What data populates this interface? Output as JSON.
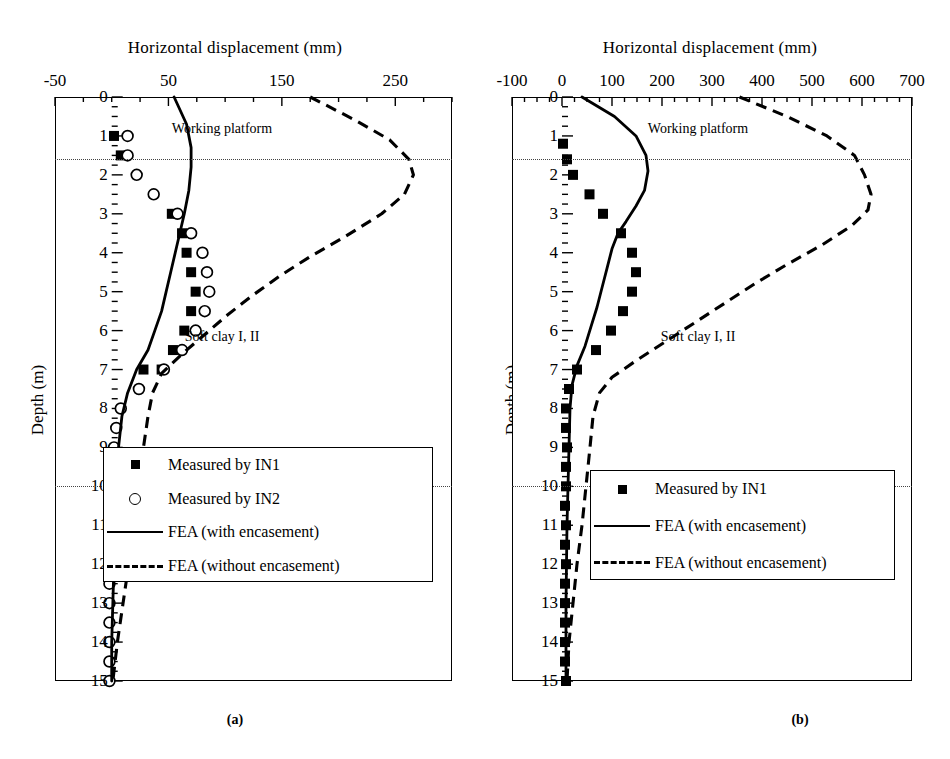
{
  "figure": {
    "panels": [
      {
        "id": "a",
        "caption": "(a)",
        "xlabel": "Horizontal displacement (mm)",
        "ylabel": "Depth (m)",
        "xticklabels": [
          "-50",
          "50",
          "150",
          "250"
        ],
        "xtickvalues": [
          -50,
          50,
          150,
          250
        ],
        "yticklabels": [
          "0",
          "1",
          "2",
          "3",
          "4",
          "5",
          "6",
          "7",
          "8",
          "9",
          "10",
          "11",
          "12",
          "13",
          "14",
          "15"
        ],
        "layer_labels": [
          "Working platform",
          "Soft clay I, II",
          "Stiff silty clay"
        ],
        "legend": [
          {
            "key": "square",
            "label": "Measured by IN1"
          },
          {
            "key": "circle",
            "label": "Measured by IN2"
          },
          {
            "key": "solid",
            "label": "FEA (with encasement)"
          },
          {
            "key": "dash",
            "label": "FEA (without encasement)"
          }
        ]
      },
      {
        "id": "b",
        "caption": "(b)",
        "xlabel": "Horizontal displacement (mm)",
        "ylabel": "Depth (m)",
        "xticklabels": [
          "-100",
          "0",
          "100",
          "200",
          "300",
          "400",
          "500",
          "600",
          "700"
        ],
        "xtickvalues": [
          -100,
          0,
          100,
          200,
          300,
          400,
          500,
          600,
          700
        ],
        "yticklabels": [
          "0",
          "1",
          "2",
          "3",
          "4",
          "5",
          "6",
          "7",
          "8",
          "9",
          "10",
          "11",
          "12",
          "13",
          "14",
          "15"
        ],
        "layer_labels": [
          "Working platform",
          "Soft clay I, II",
          "Stiff silty clay"
        ],
        "legend": [
          {
            "key": "square",
            "label": "Measured by IN1"
          },
          {
            "key": "solid",
            "label": "FEA (with encasement)"
          },
          {
            "key": "dash",
            "label": "FEA (without encasement)"
          }
        ]
      }
    ]
  },
  "chart_data": [
    {
      "type": "line",
      "title": "(a)",
      "xlabel": "Horizontal displacement (mm)",
      "ylabel": "Depth (m)",
      "xlim": [
        -50,
        300
      ],
      "ylim": [
        0,
        15
      ],
      "y_inverted": true,
      "xtick_major": [
        -50,
        50,
        150,
        250
      ],
      "xtick_minor_step": 25,
      "ytick_step": 1,
      "grid": false,
      "legend_position": "bottom-center",
      "layer_boundaries_depth_m": [
        1.6,
        10.0
      ],
      "layer_names": [
        "Working platform",
        "Soft clay I, II",
        "Stiff silty clay"
      ],
      "series": [
        {
          "name": "Measured by IN1",
          "style": "scatter-filled-square",
          "points": [
            {
              "x": 2,
              "depth": 1.0
            },
            {
              "x": 8,
              "depth": 1.5
            },
            {
              "x": 53,
              "depth": 3.0
            },
            {
              "x": 62,
              "depth": 3.5
            },
            {
              "x": 66,
              "depth": 4.0
            },
            {
              "x": 70,
              "depth": 4.5
            },
            {
              "x": 74,
              "depth": 5.0
            },
            {
              "x": 70,
              "depth": 5.5
            },
            {
              "x": 64,
              "depth": 6.0
            },
            {
              "x": 54,
              "depth": 6.5
            },
            {
              "x": 44,
              "depth": 7.0
            },
            {
              "x": 28,
              "depth": 7.0
            }
          ]
        },
        {
          "name": "Measured by IN2",
          "style": "scatter-open-circle",
          "points": [
            {
              "x": 14,
              "depth": 1.0
            },
            {
              "x": 14,
              "depth": 1.5
            },
            {
              "x": 22,
              "depth": 2.0
            },
            {
              "x": 37,
              "depth": 2.5
            },
            {
              "x": 58,
              "depth": 3.0
            },
            {
              "x": 70,
              "depth": 3.5
            },
            {
              "x": 80,
              "depth": 4.0
            },
            {
              "x": 84,
              "depth": 4.5
            },
            {
              "x": 86,
              "depth": 5.0
            },
            {
              "x": 82,
              "depth": 5.5
            },
            {
              "x": 74,
              "depth": 6.0
            },
            {
              "x": 62,
              "depth": 6.5
            },
            {
              "x": 46,
              "depth": 7.0
            },
            {
              "x": 24,
              "depth": 7.5
            },
            {
              "x": 8,
              "depth": 8.0
            },
            {
              "x": 4,
              "depth": 8.5
            },
            {
              "x": 2,
              "depth": 9.0
            },
            {
              "x": 1,
              "depth": 9.5
            },
            {
              "x": 0,
              "depth": 10.0
            },
            {
              "x": 0,
              "depth": 10.5
            },
            {
              "x": 0,
              "depth": 11.0
            },
            {
              "x": -1,
              "depth": 11.5
            },
            {
              "x": -1,
              "depth": 12.0
            },
            {
              "x": -2,
              "depth": 12.5
            },
            {
              "x": -2,
              "depth": 13.0
            },
            {
              "x": -2,
              "depth": 13.5
            },
            {
              "x": -2,
              "depth": 14.0
            },
            {
              "x": -2,
              "depth": 14.5
            },
            {
              "x": -2,
              "depth": 15.0
            }
          ]
        },
        {
          "name": "FEA (with encasement)",
          "style": "solid-line",
          "points": [
            {
              "x": 55,
              "depth": 0.0
            },
            {
              "x": 66,
              "depth": 0.7
            },
            {
              "x": 70,
              "depth": 1.3
            },
            {
              "x": 70,
              "depth": 1.8
            },
            {
              "x": 68,
              "depth": 2.4
            },
            {
              "x": 64,
              "depth": 3.0
            },
            {
              "x": 60,
              "depth": 3.5
            },
            {
              "x": 56,
              "depth": 4.0
            },
            {
              "x": 52,
              "depth": 4.5
            },
            {
              "x": 48,
              "depth": 5.0
            },
            {
              "x": 44,
              "depth": 5.5
            },
            {
              "x": 38,
              "depth": 6.0
            },
            {
              "x": 32,
              "depth": 6.5
            },
            {
              "x": 22,
              "depth": 7.0
            },
            {
              "x": 14,
              "depth": 7.6
            },
            {
              "x": 9,
              "depth": 8.2
            },
            {
              "x": 6,
              "depth": 9.0
            },
            {
              "x": 4,
              "depth": 10.0
            },
            {
              "x": 3,
              "depth": 11.0
            },
            {
              "x": 2,
              "depth": 12.0
            },
            {
              "x": 1,
              "depth": 13.0
            },
            {
              "x": 0,
              "depth": 14.0
            },
            {
              "x": 0,
              "depth": 15.0
            }
          ]
        },
        {
          "name": "FEA (without encasement)",
          "style": "dashed-line",
          "points": [
            {
              "x": 175,
              "depth": 0.0
            },
            {
              "x": 215,
              "depth": 0.6
            },
            {
              "x": 245,
              "depth": 1.1
            },
            {
              "x": 262,
              "depth": 1.6
            },
            {
              "x": 266,
              "depth": 2.0
            },
            {
              "x": 258,
              "depth": 2.5
            },
            {
              "x": 238,
              "depth": 3.0
            },
            {
              "x": 205,
              "depth": 3.6
            },
            {
              "x": 175,
              "depth": 4.1
            },
            {
              "x": 148,
              "depth": 4.6
            },
            {
              "x": 124,
              "depth": 5.1
            },
            {
              "x": 102,
              "depth": 5.6
            },
            {
              "x": 82,
              "depth": 6.1
            },
            {
              "x": 62,
              "depth": 6.6
            },
            {
              "x": 44,
              "depth": 7.1
            },
            {
              "x": 36,
              "depth": 7.6
            },
            {
              "x": 32,
              "depth": 8.2
            },
            {
              "x": 28,
              "depth": 9.0
            },
            {
              "x": 24,
              "depth": 10.0
            },
            {
              "x": 20,
              "depth": 11.0
            },
            {
              "x": 15,
              "depth": 12.0
            },
            {
              "x": 10,
              "depth": 13.0
            },
            {
              "x": 5,
              "depth": 14.0
            },
            {
              "x": 1,
              "depth": 15.0
            }
          ]
        }
      ]
    },
    {
      "type": "line",
      "title": "(b)",
      "xlabel": "Horizontal displacement (mm)",
      "ylabel": "Depth (m)",
      "xlim": [
        -100,
        700
      ],
      "ylim": [
        0,
        15
      ],
      "y_inverted": true,
      "xtick_major": [
        -100,
        0,
        100,
        200,
        300,
        400,
        500,
        600,
        700
      ],
      "xtick_minor_step": 25,
      "ytick_step": 1,
      "grid": false,
      "legend_position": "bottom-center",
      "layer_boundaries_depth_m": [
        1.6,
        10.0
      ],
      "layer_names": [
        "Working platform",
        "Soft clay I, II",
        "Stiff silty clay"
      ],
      "series": [
        {
          "name": "Measured by IN1",
          "style": "scatter-filled-square",
          "points": [
            {
              "x": 2,
              "depth": 1.2
            },
            {
              "x": 10,
              "depth": 1.6
            },
            {
              "x": 22,
              "depth": 2.0
            },
            {
              "x": 55,
              "depth": 2.5
            },
            {
              "x": 82,
              "depth": 3.0
            },
            {
              "x": 118,
              "depth": 3.5
            },
            {
              "x": 140,
              "depth": 4.0
            },
            {
              "x": 148,
              "depth": 4.5
            },
            {
              "x": 140,
              "depth": 5.0
            },
            {
              "x": 122,
              "depth": 5.5
            },
            {
              "x": 98,
              "depth": 6.0
            },
            {
              "x": 68,
              "depth": 6.5
            },
            {
              "x": 30,
              "depth": 7.0
            },
            {
              "x": 14,
              "depth": 7.5
            },
            {
              "x": 8,
              "depth": 8.0
            },
            {
              "x": 8,
              "depth": 8.5
            },
            {
              "x": 10,
              "depth": 9.0
            },
            {
              "x": 8,
              "depth": 9.5
            },
            {
              "x": 8,
              "depth": 10.0
            },
            {
              "x": 6,
              "depth": 10.5
            },
            {
              "x": 8,
              "depth": 11.0
            },
            {
              "x": 6,
              "depth": 11.5
            },
            {
              "x": 8,
              "depth": 12.0
            },
            {
              "x": 6,
              "depth": 12.5
            },
            {
              "x": 6,
              "depth": 13.0
            },
            {
              "x": 6,
              "depth": 13.5
            },
            {
              "x": 6,
              "depth": 14.0
            },
            {
              "x": 6,
              "depth": 14.5
            },
            {
              "x": 8,
              "depth": 15.0
            }
          ]
        },
        {
          "name": "FEA (with encasement)",
          "style": "solid-line",
          "points": [
            {
              "x": 40,
              "depth": 0.0
            },
            {
              "x": 105,
              "depth": 0.5
            },
            {
              "x": 148,
              "depth": 1.0
            },
            {
              "x": 168,
              "depth": 1.5
            },
            {
              "x": 172,
              "depth": 1.9
            },
            {
              "x": 165,
              "depth": 2.4
            },
            {
              "x": 148,
              "depth": 2.8
            },
            {
              "x": 128,
              "depth": 3.2
            },
            {
              "x": 112,
              "depth": 3.5
            },
            {
              "x": 100,
              "depth": 3.9
            },
            {
              "x": 90,
              "depth": 4.4
            },
            {
              "x": 80,
              "depth": 4.9
            },
            {
              "x": 70,
              "depth": 5.4
            },
            {
              "x": 58,
              "depth": 5.9
            },
            {
              "x": 46,
              "depth": 6.4
            },
            {
              "x": 30,
              "depth": 6.9
            },
            {
              "x": 20,
              "depth": 7.4
            },
            {
              "x": 16,
              "depth": 8.0
            },
            {
              "x": 14,
              "depth": 9.0
            },
            {
              "x": 12,
              "depth": 10.0
            },
            {
              "x": 10,
              "depth": 11.0
            },
            {
              "x": 9,
              "depth": 12.0
            },
            {
              "x": 8,
              "depth": 13.0
            },
            {
              "x": 8,
              "depth": 14.0
            },
            {
              "x": 8,
              "depth": 15.0
            }
          ]
        },
        {
          "name": "FEA (without encasement)",
          "style": "dashed-line",
          "points": [
            {
              "x": 355,
              "depth": 0.0
            },
            {
              "x": 450,
              "depth": 0.5
            },
            {
              "x": 530,
              "depth": 1.0
            },
            {
              "x": 585,
              "depth": 1.5
            },
            {
              "x": 605,
              "depth": 2.0
            },
            {
              "x": 618,
              "depth": 2.5
            },
            {
              "x": 612,
              "depth": 2.9
            },
            {
              "x": 580,
              "depth": 3.3
            },
            {
              "x": 520,
              "depth": 3.8
            },
            {
              "x": 450,
              "depth": 4.3
            },
            {
              "x": 385,
              "depth": 4.8
            },
            {
              "x": 325,
              "depth": 5.3
            },
            {
              "x": 265,
              "depth": 5.8
            },
            {
              "x": 205,
              "depth": 6.3
            },
            {
              "x": 145,
              "depth": 6.8
            },
            {
              "x": 100,
              "depth": 7.2
            },
            {
              "x": 75,
              "depth": 7.6
            },
            {
              "x": 62,
              "depth": 8.2
            },
            {
              "x": 56,
              "depth": 9.0
            },
            {
              "x": 48,
              "depth": 10.0
            },
            {
              "x": 40,
              "depth": 11.0
            },
            {
              "x": 30,
              "depth": 12.0
            },
            {
              "x": 22,
              "depth": 13.0
            },
            {
              "x": 14,
              "depth": 14.0
            },
            {
              "x": 10,
              "depth": 15.0
            }
          ]
        }
      ]
    }
  ]
}
